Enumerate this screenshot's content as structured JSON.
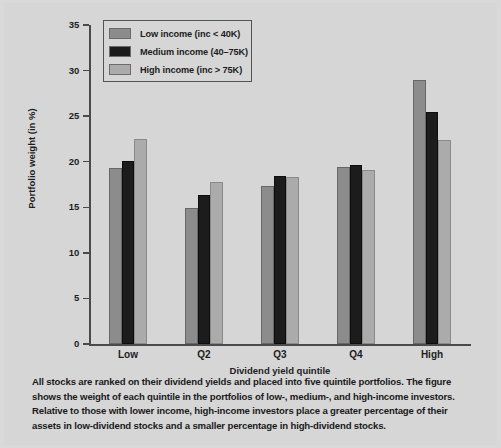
{
  "chart_data": {
    "type": "bar",
    "title": "",
    "xlabel": "Dividend yield quintile",
    "ylabel": "Portfolio weight (in %)",
    "ylim": [
      0,
      35
    ],
    "yticks": [
      0,
      5,
      10,
      15,
      20,
      25,
      30,
      35
    ],
    "grid": false,
    "legend_position": "top-left",
    "categories": [
      "Low",
      "Q2",
      "Q3",
      "Q4",
      "High"
    ],
    "series": [
      {
        "name": "Low income (inc < 40K)",
        "color": "#8c8c8c",
        "values": [
          19.3,
          14.9,
          17.3,
          19.4,
          29.0
        ]
      },
      {
        "name": "Medium income (40–75K)",
        "color": "#1c1c1c",
        "values": [
          20.1,
          16.4,
          18.4,
          19.6,
          25.5
        ]
      },
      {
        "name": "High income (inc > 75K)",
        "color": "#ababab",
        "values": [
          22.5,
          17.8,
          18.3,
          19.1,
          22.4
        ]
      }
    ]
  },
  "caption": {
    "text": "All stocks are ranked on their dividend yields and placed into five quintile portfolios. The figure shows the weight of each quintile in the portfolios of low-, medium-, and high-income investors. Relative to those with lower income, high-income investors place a greater percentage of their assets in low-dividend stocks and a smaller percentage in high-dividend stocks."
  },
  "colors": {
    "background": "#d6d6d6",
    "axis": "#4a4a4a",
    "text": "#1d1d1d",
    "series_low": "#8c8c8c",
    "series_medium": "#1c1c1c",
    "series_high": "#ababab"
  }
}
